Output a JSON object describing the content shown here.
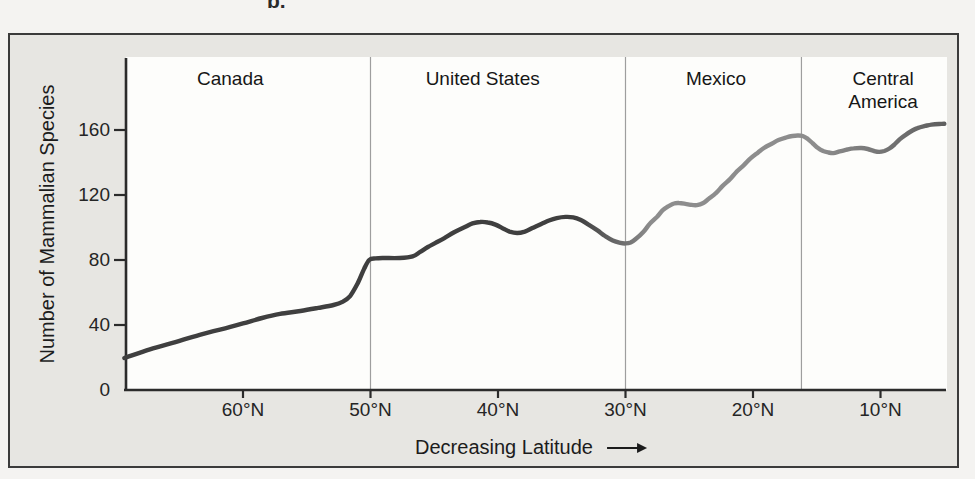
{
  "figure_label": "b.",
  "colors": {
    "frame_background": "#e7e6e2",
    "frame_border": "#3b3b3b",
    "panel_background": "#fdfdfb",
    "axis": "#2b2b2b",
    "divider_line": "#9e9e9e",
    "curve_dark": "#3f3f3f",
    "curve_light": "#8d8d8d",
    "curve_end": "#5e5e5e",
    "text": "#1c1c1c"
  },
  "chart_data": {
    "type": "line",
    "title": "",
    "xlabel": "Decreasing Latitude",
    "xlabel_arrow": "right",
    "ylabel": "Number of Mammalian Species",
    "grid": false,
    "legend": "none",
    "x_axis": {
      "unit": "degrees north latitude",
      "direction": "latitude decreases left to right",
      "range_lat": [
        69.3,
        5.0
      ],
      "ticks": [
        {
          "lat": 60,
          "label": "60°N"
        },
        {
          "lat": 50,
          "label": "50°N"
        },
        {
          "lat": 40,
          "label": "40°N"
        },
        {
          "lat": 30,
          "label": "30°N"
        },
        {
          "lat": 20,
          "label": "20°N"
        },
        {
          "lat": 10,
          "label": "10°N"
        }
      ]
    },
    "y_axis": {
      "range": [
        0,
        200
      ],
      "ticks": [
        {
          "value": 0,
          "label": "0"
        },
        {
          "value": 40,
          "label": "40"
        },
        {
          "value": 80,
          "label": "80"
        },
        {
          "value": 120,
          "label": "120"
        },
        {
          "value": 160,
          "label": "160"
        }
      ]
    },
    "region_dividers_lat": [
      50,
      30,
      16.2
    ],
    "regions": [
      {
        "lines": [
          "Canada"
        ],
        "label_center_lat": 61.0
      },
      {
        "lines": [
          "United States"
        ],
        "label_center_lat": 41.2
      },
      {
        "lines": [
          "Mexico"
        ],
        "label_center_lat": 22.9
      },
      {
        "lines": [
          "Central",
          "America"
        ],
        "label_center_lat": 9.8
      }
    ],
    "series": [
      {
        "name": "Mammalian species richness vs latitude",
        "points": [
          [
            69.3,
            19.7
          ],
          [
            67.3,
            25
          ],
          [
            65.3,
            29.5
          ],
          [
            63.4,
            34
          ],
          [
            61.4,
            38
          ],
          [
            60,
            41
          ],
          [
            58.5,
            44.3
          ],
          [
            57.1,
            46.8
          ],
          [
            55.5,
            48.6
          ],
          [
            54.1,
            50.5
          ],
          [
            52.9,
            52.3
          ],
          [
            52.2,
            54.2
          ],
          [
            51.6,
            57.8
          ],
          [
            51,
            65.8
          ],
          [
            50.5,
            74.5
          ],
          [
            50.1,
            80
          ],
          [
            49.6,
            81
          ],
          [
            48.9,
            81.2
          ],
          [
            47.7,
            81.2
          ],
          [
            46.7,
            82.2
          ],
          [
            46.1,
            85
          ],
          [
            45.5,
            88
          ],
          [
            44.9,
            90.5
          ],
          [
            44.2,
            93.5
          ],
          [
            43.4,
            97.2
          ],
          [
            42.6,
            100.3
          ],
          [
            42,
            102.5
          ],
          [
            41.4,
            103.4
          ],
          [
            40.8,
            103.1
          ],
          [
            40.2,
            101.8
          ],
          [
            39.6,
            99.4
          ],
          [
            39.1,
            97.5
          ],
          [
            38.5,
            96.6
          ],
          [
            37.9,
            97.5
          ],
          [
            37.3,
            99.7
          ],
          [
            36.6,
            102.2
          ],
          [
            36,
            104.3
          ],
          [
            35.4,
            105.8
          ],
          [
            34.7,
            106.5
          ],
          [
            34.1,
            106.2
          ],
          [
            33.5,
            104.6
          ],
          [
            32.9,
            101.8
          ],
          [
            32.2,
            98.2
          ],
          [
            31.6,
            94.8
          ],
          [
            31,
            92
          ],
          [
            30.4,
            90.5
          ],
          [
            30,
            90.2
          ],
          [
            29.6,
            90.8
          ],
          [
            29.2,
            92.9
          ],
          [
            28.6,
            97.2
          ],
          [
            28.1,
            102.2
          ],
          [
            27.5,
            106.8
          ],
          [
            27.1,
            110.5
          ],
          [
            26.6,
            113.2
          ],
          [
            26.2,
            114.8
          ],
          [
            25.8,
            115.1
          ],
          [
            25.3,
            114.6
          ],
          [
            24.9,
            114
          ],
          [
            24.4,
            113.8
          ],
          [
            23.9,
            115.1
          ],
          [
            23.5,
            117.5
          ],
          [
            22.9,
            121.2
          ],
          [
            22.4,
            125.5
          ],
          [
            21.8,
            129.8
          ],
          [
            21.3,
            134.2
          ],
          [
            20.7,
            138.5
          ],
          [
            20.2,
            142.5
          ],
          [
            19.6,
            146.2
          ],
          [
            19.1,
            149.2
          ],
          [
            18.5,
            151.7
          ],
          [
            18,
            153.8
          ],
          [
            17.4,
            155.4
          ],
          [
            16.9,
            156.3
          ],
          [
            16.5,
            156.6
          ],
          [
            16.1,
            156.3
          ],
          [
            15.7,
            154.5
          ],
          [
            15.3,
            151.7
          ],
          [
            14.9,
            148.9
          ],
          [
            14.5,
            147.1
          ],
          [
            14.1,
            146.2
          ],
          [
            13.7,
            145.8
          ],
          [
            13.2,
            146.8
          ],
          [
            12.6,
            148
          ],
          [
            12.1,
            148.7
          ],
          [
            11.5,
            148.9
          ],
          [
            11,
            148.3
          ],
          [
            10.5,
            147.1
          ],
          [
            10.1,
            146.5
          ],
          [
            9.7,
            147.1
          ],
          [
            9.3,
            148.6
          ],
          [
            8.9,
            151.1
          ],
          [
            8.5,
            154.2
          ],
          [
            8,
            157.2
          ],
          [
            7.5,
            159.7
          ],
          [
            7.1,
            161.2
          ],
          [
            6.5,
            162.5
          ],
          [
            6,
            163.3
          ],
          [
            5.4,
            163.7
          ],
          [
            5,
            163.8
          ]
        ]
      }
    ]
  }
}
